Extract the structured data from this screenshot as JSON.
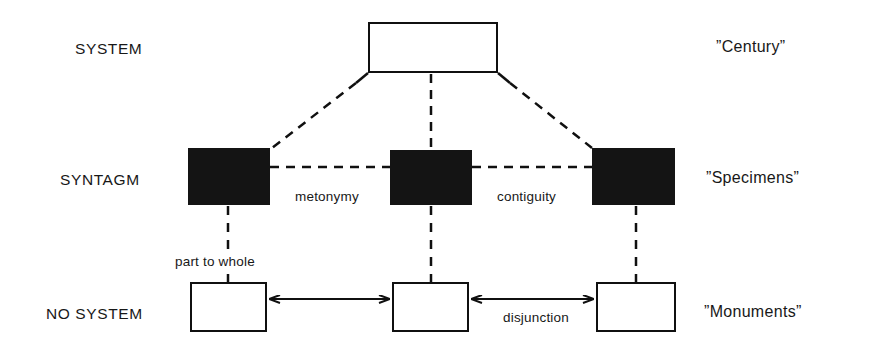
{
  "diagram": {
    "title_text_present": false,
    "tier_labels": [
      {
        "name": "system",
        "text": "SYSTEM"
      },
      {
        "name": "syntagm",
        "text": "SYNTAGM"
      },
      {
        "name": "no-system",
        "text": "NO SYSTEM"
      }
    ],
    "gloss_labels": [
      {
        "name": "century",
        "text": "Century"
      },
      {
        "name": "specimens",
        "text": "Specimens"
      },
      {
        "name": "monuments",
        "text": "Monuments"
      }
    ],
    "edge_labels": [
      {
        "name": "metonymy",
        "text": "metonymy"
      },
      {
        "name": "contiguity",
        "text": "contiguity"
      },
      {
        "name": "part-to-whole",
        "text": "part to whole"
      },
      {
        "name": "disjunction",
        "text": "disjunction"
      }
    ],
    "nodes": [
      {
        "name": "system-node",
        "style": "open",
        "x": 368,
        "y": 22,
        "w": 130,
        "h": 51
      },
      {
        "name": "syntagm-node-left",
        "style": "filled",
        "x": 188,
        "y": 148,
        "w": 82,
        "h": 57
      },
      {
        "name": "syntagm-node-middle",
        "style": "filled",
        "x": 390,
        "y": 150,
        "w": 82,
        "h": 55
      },
      {
        "name": "syntagm-node-right",
        "style": "filled",
        "x": 592,
        "y": 148,
        "w": 83,
        "h": 57
      },
      {
        "name": "no-system-node-left",
        "style": "open",
        "x": 190,
        "y": 282,
        "w": 77,
        "h": 50
      },
      {
        "name": "no-system-node-middle",
        "style": "open",
        "x": 392,
        "y": 282,
        "w": 77,
        "h": 50
      },
      {
        "name": "no-system-node-right",
        "style": "open",
        "x": 596,
        "y": 282,
        "w": 80,
        "h": 50
      }
    ],
    "colors": {
      "ink": "#101010",
      "fill": "#141414",
      "paper": "#ffffff"
    }
  }
}
